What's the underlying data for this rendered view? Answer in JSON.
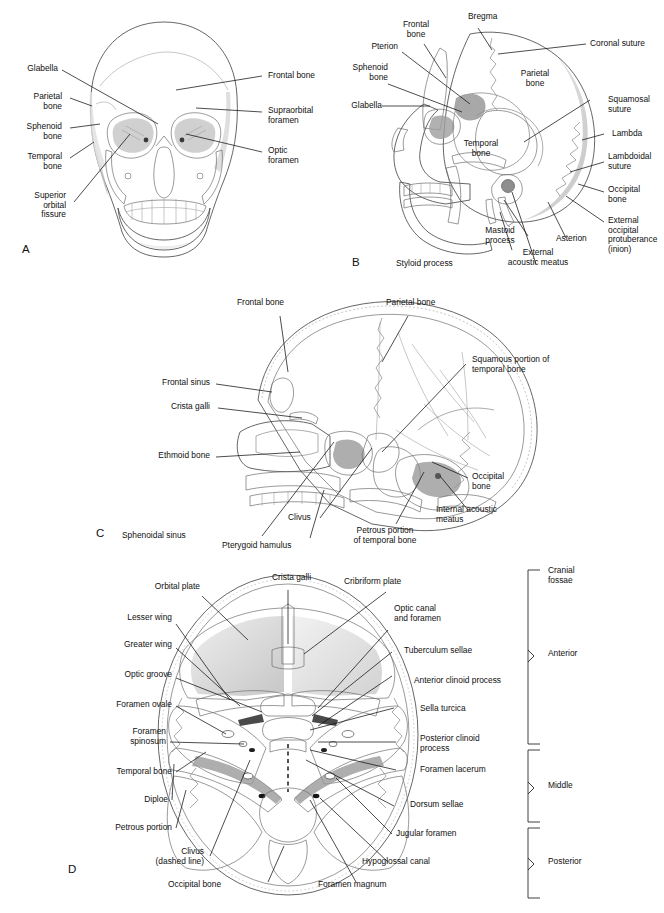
{
  "figure": {
    "background": "#ffffff",
    "ink": "#101010"
  },
  "panels": [
    {
      "id": "A",
      "letter": "A",
      "view": "Anterior view of the skull",
      "labels": [
        {
          "text": "Glabella",
          "side": "left"
        },
        {
          "text": "Parietal\nbone",
          "side": "left"
        },
        {
          "text": "Sphenoid\nbone",
          "side": "left"
        },
        {
          "text": "Temporal\nbone",
          "side": "left"
        },
        {
          "text": "Superior\norbital\nfissure",
          "side": "left"
        },
        {
          "text": "Frontal bone",
          "side": "right"
        },
        {
          "text": "Supraorbital\nforamen",
          "side": "right"
        },
        {
          "text": "Optic\nforamen",
          "side": "right"
        }
      ]
    },
    {
      "id": "B",
      "letter": "B",
      "view": "Lateral view of the skull",
      "labels": [
        {
          "text": "Frontal\nbone",
          "side": "top"
        },
        {
          "text": "Bregma",
          "side": "top"
        },
        {
          "text": "Pterion",
          "side": "left"
        },
        {
          "text": "Sphenoid\nbone",
          "side": "left"
        },
        {
          "text": "Glabella",
          "side": "left"
        },
        {
          "text": "Coronal suture",
          "side": "right"
        },
        {
          "text": "Parietal\nbone",
          "side": "inner"
        },
        {
          "text": "Temporal\nbone",
          "side": "inner"
        },
        {
          "text": "Squamosal\nsuture",
          "side": "right"
        },
        {
          "text": "Lambda",
          "side": "right"
        },
        {
          "text": "Lambdoidal\nsuture",
          "side": "right"
        },
        {
          "text": "Occipital\nbone",
          "side": "right"
        },
        {
          "text": "External\noccipital\nprotuberance\n(inion)",
          "side": "right"
        },
        {
          "text": "Asterion",
          "side": "bottom"
        },
        {
          "text": "External\nacoustic meatus",
          "side": "bottom"
        },
        {
          "text": "Mastoid\nprocess",
          "side": "bottom"
        },
        {
          "text": "Styloid process",
          "side": "bottom"
        }
      ]
    },
    {
      "id": "C",
      "letter": "C",
      "view": "Sagittal section of the skull — interior",
      "labels": [
        {
          "text": "Frontal bone",
          "side": "top"
        },
        {
          "text": "Parietal bone",
          "side": "top"
        },
        {
          "text": "Frontal sinus",
          "side": "left"
        },
        {
          "text": "Crista galli",
          "side": "left"
        },
        {
          "text": "Ethmoid bone",
          "side": "left"
        },
        {
          "text": "Squamous portion of\ntemporal bone",
          "side": "right"
        },
        {
          "text": "Occipital\nbone",
          "side": "right"
        },
        {
          "text": "Internal acoustic\nmeatus",
          "side": "right"
        },
        {
          "text": "Sphenoidal sinus",
          "side": "bottom"
        },
        {
          "text": "Pterygoid hamulus",
          "side": "bottom"
        },
        {
          "text": "Clivus",
          "side": "bottom"
        },
        {
          "text": "Petrous portion\nof temporal bone",
          "side": "bottom"
        }
      ]
    },
    {
      "id": "D",
      "letter": "D",
      "view": "Superior view of the floor of the cranial cavity",
      "labels": [
        {
          "text": "Orbital plate",
          "side": "left"
        },
        {
          "text": "Lesser wing",
          "side": "left"
        },
        {
          "text": "Greater wing",
          "side": "left"
        },
        {
          "text": "Optic groove",
          "side": "left"
        },
        {
          "text": "Foramen ovale",
          "side": "left"
        },
        {
          "text": "Foramen\nspinosum",
          "side": "left"
        },
        {
          "text": "Temporal bone",
          "side": "left"
        },
        {
          "text": "Diploe",
          "side": "left"
        },
        {
          "text": "Petrous portion",
          "side": "left"
        },
        {
          "text": "Clivus\n(dashed line)",
          "side": "left"
        },
        {
          "text": "Crista galli",
          "side": "top"
        },
        {
          "text": "Cribriform plate",
          "side": "top"
        },
        {
          "text": "Optic canal\nand foramen",
          "side": "right"
        },
        {
          "text": "Tuberculum sellae",
          "side": "right"
        },
        {
          "text": "Anterior clinoid process",
          "side": "right"
        },
        {
          "text": "Sella turcica",
          "side": "right"
        },
        {
          "text": "Posterior clinoid\nprocess",
          "side": "right"
        },
        {
          "text": "Foramen lacerum",
          "side": "right"
        },
        {
          "text": "Dorsum sellae",
          "side": "right"
        },
        {
          "text": "Jugular foramen",
          "side": "right"
        },
        {
          "text": "Hypoglossal canal",
          "side": "right"
        },
        {
          "text": "Occipital bone",
          "side": "bottom"
        },
        {
          "text": "Foramen magnum",
          "side": "bottom"
        }
      ],
      "bracket_group": {
        "header": "Cranial\nfossae",
        "items": [
          {
            "label": "Anterior"
          },
          {
            "label": "Middle"
          },
          {
            "label": "Posterior"
          }
        ]
      }
    }
  ]
}
